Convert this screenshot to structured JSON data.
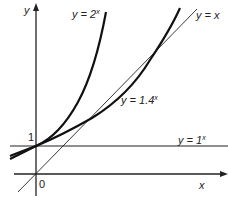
{
  "figure": {
    "type": "function-graph",
    "axes": {
      "x_label": "x",
      "y_label": "y",
      "origin_label": "0",
      "y_tick_label": "1"
    },
    "curves": [
      {
        "id": "exp2",
        "equation_prefix": "y = 2",
        "exponent": "x",
        "style": "thick"
      },
      {
        "id": "exp14",
        "equation_prefix": "y = 1.4",
        "exponent": "x",
        "style": "thick"
      },
      {
        "id": "exp1",
        "equation_prefix": "y = 1",
        "exponent": "x",
        "style": "thin-horizontal"
      },
      {
        "id": "identity",
        "equation_prefix": "y = x",
        "exponent": "",
        "style": "thin-diagonal"
      }
    ],
    "colors": {
      "ink": "#222222",
      "background": "#ffffff"
    }
  }
}
